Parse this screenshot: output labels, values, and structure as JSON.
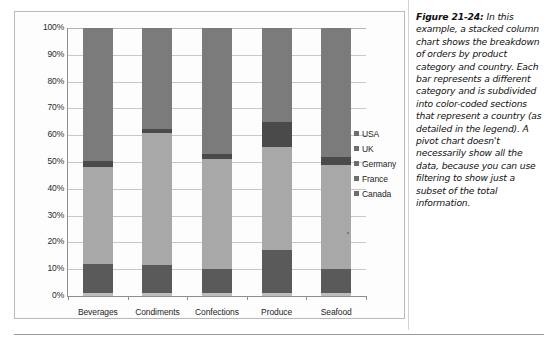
{
  "figure": {
    "number_label": "Figure 21-24:",
    "caption": "In this example, a stacked column chart shows the breakdown of orders by product category and country. Each bar represents a different category and is subdivided into color-coded sections that represent a country (as detailed in the legend). A pivot chart doesn't necessarily show all the data, because you can use filtering to show just a subset of the total information."
  },
  "chart_data": {
    "type": "bar",
    "subtype": "stacked-column-100-percent",
    "title": "",
    "xlabel": "",
    "ylabel": "",
    "ylim": [
      0,
      100
    ],
    "ytick_labels": [
      "100%",
      "90%",
      "80%",
      "70%",
      "60%",
      "50%",
      "40%",
      "30%",
      "20%",
      "10%",
      "0%"
    ],
    "ytick_values": [
      100,
      90,
      80,
      70,
      60,
      50,
      40,
      30,
      20,
      10,
      0
    ],
    "grid": true,
    "legend_position": "right",
    "categories": [
      "Beverages",
      "Condiments",
      "Confections",
      "Produce",
      "Seafood"
    ],
    "series": [
      {
        "name": "USA",
        "color": "#7b7b7b",
        "values": [
          49.5,
          37.5,
          47.0,
          35.0,
          48.0
        ]
      },
      {
        "name": "UK",
        "color": "#4a4a4a",
        "values": [
          2.5,
          1.5,
          2.0,
          9.5,
          3.0
        ]
      },
      {
        "name": "Germany",
        "color": "#a8a8a8",
        "values": [
          36.0,
          49.5,
          41.0,
          38.5,
          39.0
        ]
      },
      {
        "name": "France",
        "color": "#5a5a5a",
        "values": [
          11.0,
          10.5,
          9.0,
          16.0,
          9.0
        ]
      },
      {
        "name": "Canada",
        "color": "#bcbcbc",
        "values": [
          1.0,
          1.0,
          1.0,
          1.0,
          1.0
        ]
      }
    ],
    "stack_order_bottom_to_top": [
      "Canada",
      "France",
      "Germany",
      "UK",
      "USA"
    ]
  },
  "legend": {
    "items": [
      {
        "label": "USA",
        "color": "#6e6e6e"
      },
      {
        "label": "UK",
        "color": "#6e6e6e"
      },
      {
        "label": "Germany",
        "color": "#6e6e6e"
      },
      {
        "label": "France",
        "color": "#6e6e6e"
      },
      {
        "label": "Canada",
        "color": "#6e6e6e"
      }
    ]
  },
  "colors": {
    "grid": "#c8c8c8",
    "axis": "#8d8d8d",
    "frame": "#b9b9b9",
    "text": "#1d1d1d"
  }
}
